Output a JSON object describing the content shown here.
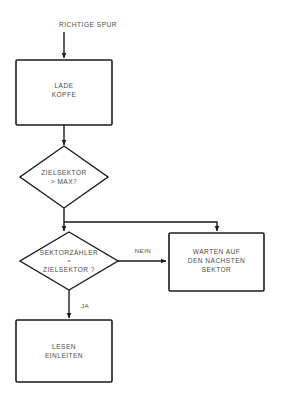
{
  "diagram": {
    "title": "RICHTIGE SPUR",
    "language": "de",
    "background_color": "#ffffff",
    "line_color": "#1b1b1b",
    "text_color": "#4a4a4a",
    "entry": {
      "label": "RICHTIGE SPUR"
    },
    "nodes": [
      {
        "id": "lade-koepfe",
        "type": "process",
        "line1": "LADE",
        "line2": "KÖPFE"
      },
      {
        "id": "zielsektor-max",
        "type": "decision",
        "line1": "ZIELSEKTOR",
        "line2": "> MAX?"
      },
      {
        "id": "sektorzaehler-vergleich",
        "type": "decision",
        "line1": "SEKTORZÄHLER",
        "line2": "=",
        "line3": "ZIELSEKTOR ?"
      },
      {
        "id": "warten-auf-sektor",
        "type": "process",
        "line1": "WARTEN AUF",
        "line2": "DEN NÄCHSTEN",
        "line3": "SEKTOR"
      },
      {
        "id": "lesen-einleiten",
        "type": "process",
        "line1": "LESEN",
        "line2": "EINLEITEN"
      }
    ],
    "edges": [
      {
        "id": "edge-nein",
        "label": "NEIN"
      },
      {
        "id": "edge-ja",
        "label": "JA"
      }
    ]
  }
}
